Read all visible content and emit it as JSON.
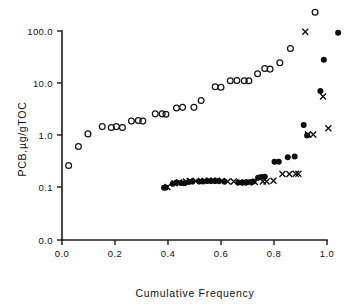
{
  "chart_data": {
    "type": "scatter",
    "title": "",
    "xlabel": "Cumulative Frequency",
    "ylabel": "PCB,µg/gTOC",
    "xlim": [
      0.0,
      1.0
    ],
    "ylim_labels": [
      "0.0",
      "0.1",
      "1.0",
      "10.0",
      "100.0"
    ],
    "yscale": "log-with-zero-base",
    "grid": false,
    "legend": "none",
    "xticks": [
      0.0,
      0.2,
      0.4,
      0.6,
      0.8,
      1.0
    ],
    "xtick_labels": [
      "0.0",
      "0.2",
      "0.4",
      "0.6",
      "0.8",
      "1.0"
    ],
    "yticks": [
      0.0,
      0.1,
      1.0,
      10.0,
      100.0
    ],
    "ytick_labels": [
      "0.0",
      "0.1",
      "1.0",
      "10.0",
      "100.0"
    ],
    "series": [
      {
        "name": "open-circles",
        "marker": "open-circle",
        "points": [
          [
            0.025,
            0.26
          ],
          [
            0.062,
            0.6
          ],
          [
            0.098,
            1.05
          ],
          [
            0.152,
            1.45
          ],
          [
            0.186,
            1.4
          ],
          [
            0.205,
            1.45
          ],
          [
            0.228,
            1.4
          ],
          [
            0.262,
            1.85
          ],
          [
            0.288,
            1.9
          ],
          [
            0.305,
            1.85
          ],
          [
            0.352,
            2.55
          ],
          [
            0.378,
            2.55
          ],
          [
            0.392,
            2.5
          ],
          [
            0.432,
            3.3
          ],
          [
            0.455,
            3.4
          ],
          [
            0.498,
            3.4
          ],
          [
            0.525,
            4.6
          ],
          [
            0.578,
            8.5
          ],
          [
            0.6,
            8.3
          ],
          [
            0.635,
            11.0
          ],
          [
            0.66,
            11.2
          ],
          [
            0.688,
            11.0
          ],
          [
            0.705,
            11.0
          ],
          [
            0.738,
            15.0
          ],
          [
            0.765,
            19.0
          ],
          [
            0.785,
            18.5
          ],
          [
            0.822,
            24.5
          ],
          [
            0.862,
            46.0
          ],
          [
            0.955,
            230.0
          ]
        ]
      },
      {
        "name": "filled-circles",
        "marker": "filled-circle",
        "points": [
          [
            0.385,
            0.097
          ],
          [
            0.392,
            0.098
          ],
          [
            0.418,
            0.115
          ],
          [
            0.432,
            0.122
          ],
          [
            0.448,
            0.12
          ],
          [
            0.462,
            0.118
          ],
          [
            0.478,
            0.125
          ],
          [
            0.492,
            0.127
          ],
          [
            0.518,
            0.128
          ],
          [
            0.532,
            0.128
          ],
          [
            0.548,
            0.13
          ],
          [
            0.562,
            0.13
          ],
          [
            0.578,
            0.13
          ],
          [
            0.592,
            0.13
          ],
          [
            0.612,
            0.128
          ],
          [
            0.665,
            0.122
          ],
          [
            0.678,
            0.122
          ],
          [
            0.688,
            0.122
          ],
          [
            0.698,
            0.123
          ],
          [
            0.712,
            0.125
          ],
          [
            0.722,
            0.128
          ],
          [
            0.74,
            0.15
          ],
          [
            0.752,
            0.155
          ],
          [
            0.765,
            0.158
          ],
          [
            0.802,
            0.305
          ],
          [
            0.818,
            0.305
          ],
          [
            0.852,
            0.375
          ],
          [
            0.878,
            0.385
          ],
          [
            0.912,
            1.55
          ],
          [
            0.925,
            0.98
          ],
          [
            0.975,
            7.0
          ],
          [
            0.988,
            28.0
          ],
          [
            1.042,
            93.0
          ]
        ]
      },
      {
        "name": "x-markers",
        "marker": "x",
        "points": [
          [
            0.398,
            0.1
          ],
          [
            0.425,
            0.118
          ],
          [
            0.442,
            0.122
          ],
          [
            0.468,
            0.128
          ],
          [
            0.482,
            0.13
          ],
          [
            0.505,
            0.13
          ],
          [
            0.538,
            0.132
          ],
          [
            0.555,
            0.132
          ],
          [
            0.57,
            0.132
          ],
          [
            0.585,
            0.132
          ],
          [
            0.602,
            0.13
          ],
          [
            0.625,
            0.128
          ],
          [
            0.648,
            0.128
          ],
          [
            0.672,
            0.122
          ],
          [
            0.705,
            0.122
          ],
          [
            0.728,
            0.125
          ],
          [
            0.758,
            0.128
          ],
          [
            0.772,
            0.128
          ],
          [
            0.798,
            0.132
          ],
          [
            0.832,
            0.178
          ],
          [
            0.858,
            0.178
          ],
          [
            0.882,
            0.18
          ],
          [
            0.892,
            0.18
          ],
          [
            0.928,
            1.02
          ],
          [
            0.948,
            1.02
          ],
          [
            0.985,
            5.5
          ],
          [
            1.005,
            1.35
          ],
          [
            0.918,
            97.0
          ]
        ]
      }
    ]
  }
}
